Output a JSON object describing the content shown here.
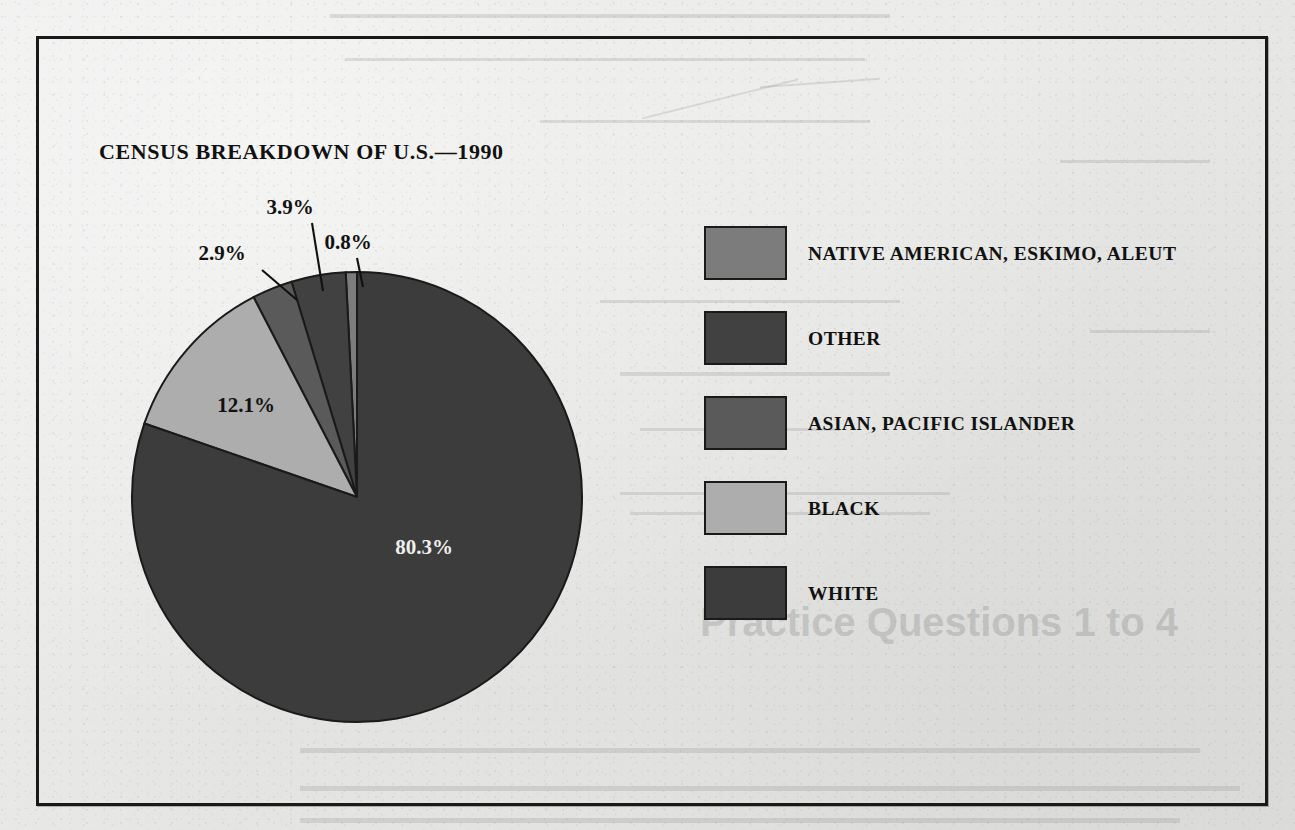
{
  "page": {
    "background_color": "#e8e8e6",
    "frame_border_color": "#191919"
  },
  "chart_data": {
    "type": "pie",
    "title": "CENSUS BREAKDOWN OF U.S.—1990",
    "xlabel": "",
    "ylabel": "",
    "legend_position": "right",
    "grid": false,
    "unit": "%",
    "categories": [
      "NATIVE AMERICAN, ESKIMO, ALEUT",
      "OTHER",
      "ASIAN, PACIFIC ISLANDER",
      "BLACK",
      "WHITE"
    ],
    "values": [
      0.8,
      3.9,
      2.9,
      12.1,
      80.3
    ],
    "colors": [
      "#7c7c7c",
      "#414141",
      "#5a5a5a",
      "#adadad",
      "#3c3c3c"
    ],
    "slices": [
      {
        "label": "NATIVE AMERICAN, ESKIMO, ALEUT",
        "value": 0.8,
        "value_label": "0.8%",
        "color": "#7c7c7c",
        "label_placement": "outside-leader",
        "label_x": 348,
        "label_y": 249,
        "leader_from_x": 357,
        "leader_from_y": 258,
        "leader_to_x": 363,
        "leader_to_y": 287
      },
      {
        "label": "OTHER",
        "value": 3.9,
        "value_label": "3.9%",
        "color": "#414141",
        "label_placement": "outside-leader",
        "label_x": 290,
        "label_y": 214,
        "leader_from_x": 312,
        "leader_from_y": 223,
        "leader_to_x": 323,
        "leader_to_y": 291
      },
      {
        "label": "ASIAN, PACIFIC ISLANDER",
        "value": 2.9,
        "value_label": "2.9%",
        "color": "#5a5a5a",
        "label_placement": "outside-leader",
        "label_x": 222,
        "label_y": 260,
        "leader_from_x": 262,
        "leader_from_y": 270,
        "leader_to_x": 297,
        "leader_to_y": 300
      },
      {
        "label": "BLACK",
        "value": 12.1,
        "value_label": "12.1%",
        "color": "#adadad",
        "label_placement": "inside-dark-text",
        "label_x": 246,
        "label_y": 412
      },
      {
        "label": "WHITE",
        "value": 80.3,
        "value_label": "80.3%",
        "color": "#3c3c3c",
        "label_placement": "inside-light-text",
        "label_x": 424,
        "label_y": 554
      }
    ],
    "geometry": {
      "center_x": 357,
      "center_y": 497,
      "radius": 225,
      "start_angle_deg": -90,
      "direction": "counterclockwise",
      "slice_outline_color": "#1a1a1a"
    }
  },
  "legend": {
    "items": [
      {
        "label": "NATIVE AMERICAN, ESKIMO, ALEUT",
        "color": "#7c7c7c"
      },
      {
        "label": "OTHER",
        "color": "#414141"
      },
      {
        "label": "ASIAN, PACIFIC ISLANDER",
        "color": "#5a5a5a"
      },
      {
        "label": "BLACK",
        "color": "#adadad"
      },
      {
        "label": "WHITE",
        "color": "#3c3c3c"
      }
    ]
  }
}
